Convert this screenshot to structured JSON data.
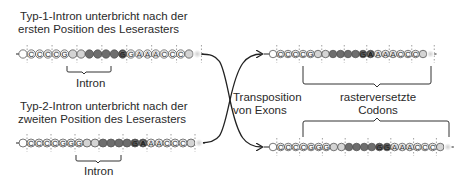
{
  "labels": {
    "type1_line1": "Typ-1-Intron unterbricht nach der",
    "type1_line2": "ersten Position des Leserasters",
    "type2_line1": "Typ-2-Intron unterbricht nach der",
    "type2_line2": "zweiten Position des Leserasters",
    "intron_top": "Intron",
    "intron_bottom": "Intron",
    "transposition_line1": "Transposition",
    "transposition_line2": "von Exons",
    "shifted_line1": "rasterversetzte",
    "shifted_line2": "Codons"
  },
  "colors": {
    "bead_outline": "#555555",
    "bead_white": "#ffffff",
    "bead_light": "#d4d4d4",
    "bead_dark": "#6e6e6e",
    "bead_darker": "#4a4a4a",
    "line": "#222222"
  },
  "strands": {
    "top_left": {
      "beads": [
        "",
        "C",
        "C",
        "C",
        "C",
        "G",
        "",
        "",
        "",
        "",
        "",
        "",
        "G",
        "G",
        "A",
        "A",
        "A",
        "C",
        "C",
        "C",
        "",
        ""
      ],
      "shades": [
        "w",
        "w",
        "w",
        "w",
        "w",
        "w",
        "l",
        "l",
        "d",
        "d",
        "d",
        "d",
        "k",
        "w",
        "w",
        "w",
        "w",
        "w",
        "w",
        "w",
        "l",
        "f"
      ]
    },
    "bottom_left": {
      "beads": [
        "",
        "C",
        "C",
        "C",
        "C",
        "G",
        "G",
        "G",
        "",
        "",
        "",
        "",
        "",
        "",
        "G",
        "A",
        "A",
        "A",
        "C",
        "C",
        "C",
        "",
        ""
      ],
      "shades": [
        "w",
        "w",
        "w",
        "w",
        "w",
        "w",
        "w",
        "w",
        "l",
        "l",
        "d",
        "d",
        "d",
        "d",
        "k",
        "k",
        "w",
        "w",
        "w",
        "w",
        "w",
        "l",
        "f"
      ]
    },
    "top_right": {
      "beads": [
        "",
        "C",
        "C",
        "C",
        "C",
        "G",
        "",
        "",
        "",
        "",
        "",
        "",
        "G",
        "A",
        "A",
        "A",
        "A",
        "C",
        "C",
        "C",
        "",
        ""
      ],
      "shades": [
        "w",
        "w",
        "w",
        "w",
        "w",
        "w",
        "l",
        "l",
        "d",
        "d",
        "d",
        "d",
        "k",
        "k",
        "w",
        "w",
        "w",
        "w",
        "w",
        "w",
        "l",
        "f"
      ]
    },
    "bottom_right": {
      "beads": [
        "",
        "C",
        "C",
        "C",
        "C",
        "G",
        "G",
        "G",
        "",
        "",
        "",
        "",
        "",
        "",
        "G",
        "G",
        "A",
        "A",
        "A",
        "C",
        "C",
        "C",
        "",
        ""
      ],
      "shades": [
        "w",
        "w",
        "w",
        "w",
        "w",
        "w",
        "w",
        "w",
        "l",
        "l",
        "d",
        "d",
        "d",
        "d",
        "k",
        "k",
        "w",
        "w",
        "w",
        "w",
        "w",
        "w",
        "l",
        "f"
      ]
    }
  }
}
